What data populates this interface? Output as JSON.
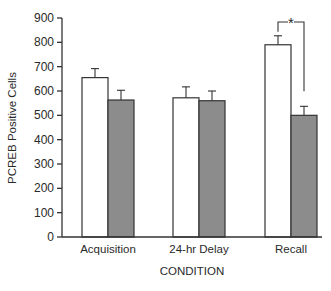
{
  "chart_data": {
    "type": "bar",
    "title": "",
    "xlabel": "CONDITION",
    "ylabel": "PCREB Positive Cells",
    "ylim": [
      0,
      900
    ],
    "yticks": [
      0,
      100,
      200,
      300,
      400,
      500,
      600,
      700,
      800,
      900
    ],
    "grid": false,
    "legend": "none",
    "categories": [
      "Acquisition",
      "24-hr Delay",
      "Recall"
    ],
    "series": [
      {
        "name": "Group 1 (open bars)",
        "color": "#ffffff",
        "values": [
          655,
          572,
          790
        ],
        "errors": [
          37,
          45,
          37
        ]
      },
      {
        "name": "Group 2 (gray bars)",
        "color": "#8a8a8a",
        "values": [
          563,
          560,
          500
        ],
        "errors": [
          40,
          40,
          37
        ]
      }
    ],
    "annotations": [
      {
        "type": "significance-bracket",
        "category": "Recall",
        "label": "*"
      }
    ]
  }
}
